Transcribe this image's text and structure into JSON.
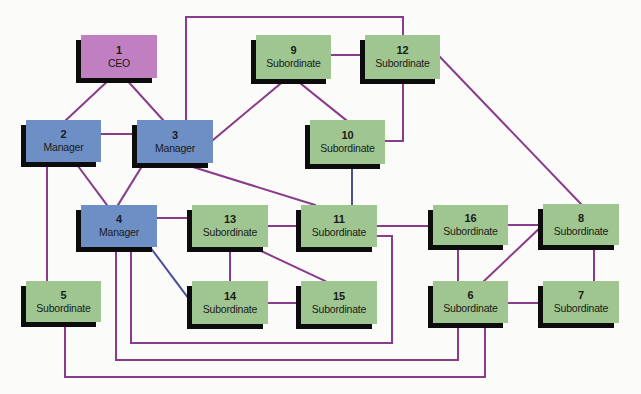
{
  "diagram": {
    "type": "organization-network",
    "caption_fragment": "",
    "colors": {
      "ceo_fill": "#c07fc0",
      "manager_fill": "#6d8fc6",
      "subordinate_fill": "#9fc690",
      "shadow": "#0c0c0c",
      "edge": "#8a3b8a",
      "edge_blue": "#4d4f96",
      "background": "#fbfbfa"
    },
    "nodes": [
      {
        "id": "1",
        "number": "1",
        "role": "CEO",
        "kind": "ceo",
        "x": 81,
        "y": 35,
        "w": 76,
        "h": 43
      },
      {
        "id": "2",
        "number": "2",
        "role": "Manager",
        "kind": "manager",
        "x": 26,
        "y": 120,
        "w": 75,
        "h": 42
      },
      {
        "id": "3",
        "number": "3",
        "role": "Manager",
        "kind": "manager",
        "x": 137,
        "y": 120,
        "w": 76,
        "h": 43
      },
      {
        "id": "4",
        "number": "4",
        "role": "Manager",
        "kind": "manager",
        "x": 81,
        "y": 205,
        "w": 76,
        "h": 42
      },
      {
        "id": "5",
        "number": "5",
        "role": "Subordinate",
        "kind": "subordinate",
        "x": 26,
        "y": 281,
        "w": 75,
        "h": 41
      },
      {
        "id": "6",
        "number": "6",
        "role": "Subordinate",
        "kind": "subordinate",
        "x": 433,
        "y": 281,
        "w": 75,
        "h": 42
      },
      {
        "id": "7",
        "number": "7",
        "role": "Subordinate",
        "kind": "subordinate",
        "x": 543,
        "y": 281,
        "w": 76,
        "h": 42
      },
      {
        "id": "8",
        "number": "8",
        "role": "Subordinate",
        "kind": "subordinate",
        "x": 543,
        "y": 204,
        "w": 76,
        "h": 41
      },
      {
        "id": "9",
        "number": "9",
        "role": "Subordinate",
        "kind": "subordinate",
        "x": 256,
        "y": 35,
        "w": 75,
        "h": 44
      },
      {
        "id": "10",
        "number": "10",
        "role": "Subordinate",
        "kind": "subordinate",
        "x": 310,
        "y": 120,
        "w": 75,
        "h": 44
      },
      {
        "id": "11",
        "number": "11",
        "role": "Subordinate",
        "kind": "subordinate",
        "x": 301,
        "y": 205,
        "w": 76,
        "h": 42
      },
      {
        "id": "12",
        "number": "12",
        "role": "Subordinate",
        "kind": "subordinate",
        "x": 365,
        "y": 35,
        "w": 75,
        "h": 44
      },
      {
        "id": "13",
        "number": "13",
        "role": "Subordinate",
        "kind": "subordinate",
        "x": 192,
        "y": 205,
        "w": 76,
        "h": 42
      },
      {
        "id": "14",
        "number": "14",
        "role": "Subordinate",
        "kind": "subordinate",
        "x": 192,
        "y": 281,
        "w": 76,
        "h": 43
      },
      {
        "id": "15",
        "number": "15",
        "role": "Subordinate",
        "kind": "subordinate",
        "x": 301,
        "y": 281,
        "w": 76,
        "h": 43
      },
      {
        "id": "16",
        "number": "16",
        "role": "Subordinate",
        "kind": "subordinate",
        "x": 433,
        "y": 205,
        "w": 75,
        "h": 40
      }
    ],
    "edges": [
      {
        "from": "1",
        "to": "2",
        "points": [
          [
            111,
            78
          ],
          [
            66,
            120
          ]
        ]
      },
      {
        "from": "1",
        "to": "3",
        "points": [
          [
            125,
            78
          ],
          [
            163,
            120
          ]
        ]
      },
      {
        "from": "2",
        "to": "3",
        "points": [
          [
            101,
            134
          ],
          [
            137,
            134
          ]
        ]
      },
      {
        "from": "2",
        "to": "4",
        "points": [
          [
            75,
            162
          ],
          [
            107,
            205
          ]
        ]
      },
      {
        "from": "3",
        "to": "4",
        "points": [
          [
            144,
            163
          ],
          [
            118,
            205
          ]
        ]
      },
      {
        "from": "3",
        "to": "9",
        "points": [
          [
            213,
            140
          ],
          [
            286,
            79
          ]
        ]
      },
      {
        "from": "3",
        "to": "12",
        "points": [
          [
            186,
            120
          ],
          [
            186,
            17
          ],
          [
            403,
            17
          ],
          [
            403,
            35
          ]
        ]
      },
      {
        "from": "3",
        "to": "11",
        "points": [
          [
            193,
            167
          ],
          [
            315,
            205
          ]
        ]
      },
      {
        "from": "9",
        "to": "12",
        "points": [
          [
            331,
            55
          ],
          [
            365,
            55
          ]
        ]
      },
      {
        "from": "9",
        "to": "10",
        "points": [
          [
            295,
            79
          ],
          [
            346,
            120
          ]
        ]
      },
      {
        "from": "12",
        "to": "10",
        "points": [
          [
            403,
            79
          ],
          [
            403,
            141
          ],
          [
            385,
            141
          ]
        ]
      },
      {
        "from": "12",
        "to": "8",
        "points": [
          [
            440,
            57
          ],
          [
            581,
            204
          ]
        ]
      },
      {
        "from": "10",
        "to": "11",
        "points": [
          [
            352,
            164
          ],
          [
            352,
            205
          ]
        ],
        "color": "blue"
      },
      {
        "from": "2",
        "to": "5",
        "points": [
          [
            47,
            167
          ],
          [
            47,
            281
          ]
        ]
      },
      {
        "from": "4",
        "to": "13",
        "points": [
          [
            157,
            218
          ],
          [
            192,
            218
          ]
        ]
      },
      {
        "from": "4",
        "to": "14",
        "points": [
          [
            150,
            247
          ],
          [
            192,
            303
          ]
        ],
        "color": "blue"
      },
      {
        "from": "13",
        "to": "11",
        "points": [
          [
            268,
            226
          ],
          [
            301,
            226
          ]
        ]
      },
      {
        "from": "13",
        "to": "14",
        "points": [
          [
            230,
            250
          ],
          [
            230,
            281
          ]
        ]
      },
      {
        "from": "13",
        "to": "15",
        "points": [
          [
            259,
            250
          ],
          [
            325,
            281
          ]
        ]
      },
      {
        "from": "14",
        "to": "15",
        "points": [
          [
            268,
            303
          ],
          [
            301,
            303
          ]
        ]
      },
      {
        "from": "11",
        "to": "16",
        "points": [
          [
            377,
            226
          ],
          [
            433,
            226
          ]
        ]
      },
      {
        "from": "11",
        "to": "4",
        "points": [
          [
            377,
            236
          ],
          [
            392,
            236
          ],
          [
            392,
            343
          ],
          [
            131,
            343
          ],
          [
            131,
            251
          ]
        ]
      },
      {
        "from": "4",
        "to": "6",
        "points": [
          [
            116,
            251
          ],
          [
            116,
            360
          ],
          [
            458,
            360
          ],
          [
            458,
            326
          ]
        ]
      },
      {
        "from": "5",
        "to": "6",
        "points": [
          [
            65,
            326
          ],
          [
            65,
            377
          ],
          [
            485,
            377
          ],
          [
            485,
            326
          ]
        ]
      },
      {
        "from": "16",
        "to": "8",
        "points": [
          [
            508,
            225
          ],
          [
            543,
            225
          ]
        ]
      },
      {
        "from": "16",
        "to": "6",
        "points": [
          [
            458,
            250
          ],
          [
            458,
            281
          ]
        ]
      },
      {
        "from": "8",
        "to": "6",
        "points": [
          [
            543,
            225
          ],
          [
            484,
            281
          ]
        ]
      },
      {
        "from": "8",
        "to": "7",
        "points": [
          [
            594,
            250
          ],
          [
            594,
            281
          ]
        ]
      },
      {
        "from": "6",
        "to": "7",
        "points": [
          [
            508,
            303
          ],
          [
            543,
            303
          ]
        ]
      }
    ]
  }
}
